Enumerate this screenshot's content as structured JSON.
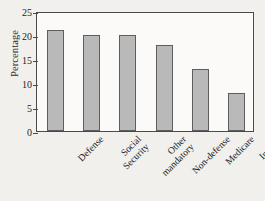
{
  "chart_data": {
    "type": "bar",
    "title": "",
    "xlabel": "",
    "ylabel": "Percentage",
    "categories": [
      "Defense",
      "Social Security",
      "Other mandatory",
      "Non-defense",
      "Medicare",
      "Interest"
    ],
    "category_lines": [
      [
        "Defense"
      ],
      [
        "Social",
        "Security"
      ],
      [
        "Other",
        "mandatory"
      ],
      [
        "Non-defense"
      ],
      [
        "Medicare"
      ],
      [
        "Interest"
      ]
    ],
    "values": [
      21,
      20,
      20,
      18,
      13,
      8
    ],
    "ylim": [
      0,
      25
    ],
    "yticks": [
      0,
      5,
      10,
      15,
      20,
      25
    ],
    "ytick_labels": [
      "0",
      "5",
      "10",
      "15",
      "20",
      "25"
    ],
    "grid": false,
    "legend": null,
    "bar_color": "#b9b9b9",
    "bar_edge_color": "#5d5d5d",
    "axis_color": "#4a4a4a",
    "plot_background": "#fbfaf8",
    "page_background": "#f2f0ec",
    "xtick_label_rotation": -45
  }
}
